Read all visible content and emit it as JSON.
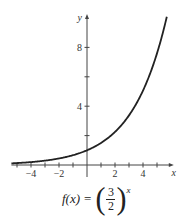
{
  "chart_data": {
    "type": "line",
    "title": "",
    "function": "f(x) = (3/2)^x",
    "xlabel": "x",
    "ylabel": "y",
    "xlim": [
      -5.4,
      5.7
    ],
    "ylim": [
      -0.5,
      10
    ],
    "x_ticks": [
      -5,
      -4,
      -3,
      -2,
      -1,
      1,
      2,
      3,
      4,
      5
    ],
    "x_tick_labels": [
      {
        "value": -4,
        "label": "−4"
      },
      {
        "value": -2,
        "label": "−2"
      },
      {
        "value": 2,
        "label": "2"
      },
      {
        "value": 4,
        "label": "4"
      }
    ],
    "y_ticks": [
      2,
      4,
      6,
      8
    ],
    "y_tick_labels": [
      {
        "value": 4,
        "label": "4"
      },
      {
        "value": 8,
        "label": "8"
      }
    ],
    "grid": false,
    "series": [
      {
        "name": "f(x) = (3/2)^x",
        "x": [
          -5.4,
          -5,
          -4,
          -3,
          -2,
          -1,
          0,
          1,
          2,
          3,
          4,
          5,
          5.7
        ],
        "values": [
          0.112,
          0.132,
          0.198,
          0.296,
          0.444,
          0.667,
          1,
          1.5,
          2.25,
          3.375,
          5.063,
          7.594,
          10.08
        ]
      }
    ],
    "color": "#222222"
  },
  "formula": {
    "lhs": "f(x)",
    "eq": "=",
    "numerator": "3",
    "denominator": "2",
    "exponent": "x"
  },
  "axis_labels": {
    "x": "x",
    "y": "y"
  }
}
